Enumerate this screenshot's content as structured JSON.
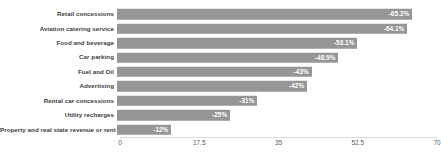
{
  "chart_data": {
    "type": "bar",
    "orientation": "horizontal",
    "title": "",
    "subtitle": "",
    "xlabel": "",
    "ylabel": "",
    "xlim": [
      0,
      70
    ],
    "grid": false,
    "legend": null,
    "axis_ticks": [
      "0",
      "17.5",
      "35",
      "52.5",
      "70"
    ],
    "axis_tick_values": [
      0,
      17.5,
      35,
      52.5,
      70
    ],
    "categories": [
      "Retail concessions",
      "Aviation catering service",
      "Food and beverage",
      "Car parking",
      "Fuel and Oil",
      "Advertising",
      "Rental car concessions",
      "Utility recharges",
      "Property and real state revenue or rent"
    ],
    "values": [
      65.2,
      64.1,
      53.1,
      48.9,
      43,
      42,
      31,
      25,
      12
    ],
    "data_labels": [
      "-65.2%",
      "-64.1%",
      "-53.1%",
      "-48.9%",
      "-43%",
      "-42%",
      "-31%",
      "-25%",
      "-12%"
    ],
    "bar_color": "#969696",
    "label_color": "#ffffff",
    "axis_color": "#d9d9d9",
    "tick_text_color": "#5a5a5a",
    "category_text_color": "#3c3c3c"
  }
}
